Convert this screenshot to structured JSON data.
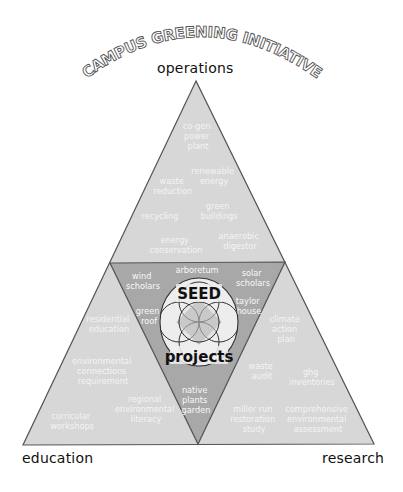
{
  "title": "CAMPUS GREENING INITIATIVE",
  "corners": {
    "top": "operations",
    "bottom_left": "education",
    "bottom_right": "research"
  },
  "center": {
    "line1": "SEED",
    "line2": "projects"
  },
  "colors": {
    "outer_fill": "#d7d7d7",
    "inner_fill": "#a8a8a8",
    "stroke": "#555555",
    "label_text": "#f4f4f4",
    "circle_fill": "#eaeaea",
    "circle_accent": "#7a7a7a"
  },
  "operations": [
    {
      "lines": [
        "co-gen",
        "power",
        "plant"
      ]
    },
    {
      "lines": [
        "renewable",
        "energy"
      ]
    },
    {
      "lines": [
        "waste",
        "reduction"
      ]
    },
    {
      "lines": [
        "green",
        "buildings"
      ]
    },
    {
      "lines": [
        "recycling"
      ]
    },
    {
      "lines": [
        "energy",
        "conservation"
      ]
    },
    {
      "lines": [
        "anaerobic",
        "digestor"
      ]
    }
  ],
  "seed_projects": [
    {
      "lines": [
        "arboretum"
      ]
    },
    {
      "lines": [
        "wind",
        "scholars"
      ]
    },
    {
      "lines": [
        "solar",
        "scholars"
      ]
    },
    {
      "lines": [
        "green",
        "roof"
      ]
    },
    {
      "lines": [
        "taylor",
        "house"
      ]
    },
    {
      "lines": [
        "native",
        "plants",
        "garden"
      ]
    }
  ],
  "education": [
    {
      "lines": [
        "residential",
        "education"
      ]
    },
    {
      "lines": [
        "environmental",
        "connections",
        "requirement"
      ]
    },
    {
      "lines": [
        "regional",
        "environmental",
        "literacy"
      ]
    },
    {
      "lines": [
        "curricular",
        "workshops"
      ]
    }
  ],
  "research": [
    {
      "lines": [
        "climate",
        "action",
        "plan"
      ]
    },
    {
      "lines": [
        "waste",
        "audit"
      ]
    },
    {
      "lines": [
        "ghg",
        "inventories"
      ]
    },
    {
      "lines": [
        "miller run",
        "restoration",
        "study"
      ]
    },
    {
      "lines": [
        "comprehensive",
        "environmental",
        "assessment"
      ]
    }
  ]
}
